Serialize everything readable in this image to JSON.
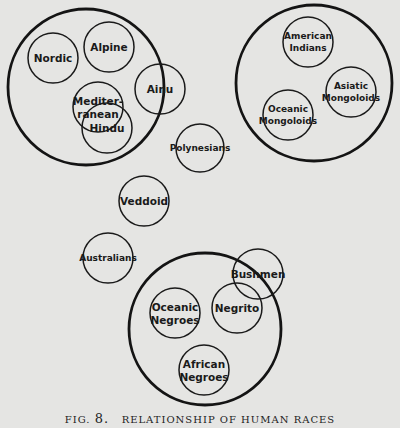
{
  "figure": {
    "fig_prefix": "FIG.",
    "fig_number": "8.",
    "title": "RELATIONSHIP OF HUMAN RACES",
    "background": "#e5e5e3",
    "line_color": "#141414"
  },
  "groups": [
    {
      "id": "caucasoid-group",
      "cx": 86,
      "cy": 87,
      "r": 78,
      "members": [
        "Nordic",
        "Alpine",
        "Mediterranean",
        "Hindu",
        "Ainu"
      ]
    },
    {
      "id": "mongoloid-group",
      "cx": 314,
      "cy": 83,
      "r": 78,
      "members": [
        "American Indians",
        "Asiatic Mongoloids",
        "Oceanic Mongoloids"
      ]
    },
    {
      "id": "negroid-group",
      "cx": 205,
      "cy": 329,
      "r": 76,
      "members": [
        "Oceanic Negroes",
        "Negrito",
        "African Negroes",
        "Bushmen"
      ]
    }
  ],
  "races": [
    {
      "id": "nordic",
      "lines": [
        "Nordic"
      ],
      "cx": 53,
      "cy": 58,
      "r": 25
    },
    {
      "id": "alpine",
      "lines": [
        "Alpine"
      ],
      "cx": 109,
      "cy": 47,
      "r": 25
    },
    {
      "id": "mediterranean",
      "lines": [
        "Mediter-",
        "ranean"
      ],
      "cx": 98,
      "cy": 107,
      "r": 25
    },
    {
      "id": "hindu",
      "lines": [
        "Hindu"
      ],
      "cx": 107,
      "cy": 128,
      "r": 25
    },
    {
      "id": "ainu",
      "lines": [
        "Ainu"
      ],
      "cx": 160,
      "cy": 89,
      "r": 25
    },
    {
      "id": "polynesians",
      "lines": [
        "Polynesians"
      ],
      "cx": 200,
      "cy": 148,
      "r": 24,
      "small": true
    },
    {
      "id": "veddoid",
      "lines": [
        "Veddoid"
      ],
      "cx": 144,
      "cy": 201,
      "r": 25
    },
    {
      "id": "australians",
      "lines": [
        "Australians"
      ],
      "cx": 108,
      "cy": 258,
      "r": 25,
      "small": true
    },
    {
      "id": "american-indians",
      "lines": [
        "American",
        "Indians"
      ],
      "cx": 308,
      "cy": 42,
      "r": 25,
      "small": true
    },
    {
      "id": "asiatic-mongoloids",
      "lines": [
        "Asiatic",
        "Mongoloids"
      ],
      "cx": 351,
      "cy": 92,
      "r": 25,
      "small": true
    },
    {
      "id": "oceanic-mongoloids",
      "lines": [
        "Oceanic",
        "Mongoloids"
      ],
      "cx": 288,
      "cy": 115,
      "r": 25,
      "small": true
    },
    {
      "id": "bushmen",
      "lines": [
        "Bushmen"
      ],
      "cx": 258,
      "cy": 274,
      "r": 25
    },
    {
      "id": "negrito",
      "lines": [
        "Negrito"
      ],
      "cx": 237,
      "cy": 308,
      "r": 25
    },
    {
      "id": "oceanic-negroes",
      "lines": [
        "Oceanic",
        "Negroes"
      ],
      "cx": 175,
      "cy": 313,
      "r": 25
    },
    {
      "id": "african-negroes",
      "lines": [
        "African",
        "Negroes"
      ],
      "cx": 204,
      "cy": 370,
      "r": 25
    }
  ]
}
